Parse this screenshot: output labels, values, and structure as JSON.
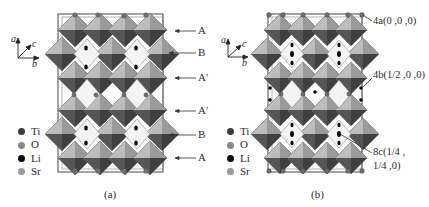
{
  "figure": {
    "panels": [
      {
        "id": "a",
        "caption": "(a)",
        "axes": {
          "a": "a",
          "b": "b",
          "c": "c"
        },
        "legend": [
          {
            "label": "Ti",
            "color": "#3a3a3a"
          },
          {
            "label": "O",
            "color": "#8a8a8a"
          },
          {
            "label": "Li",
            "color": "#0a0a0a"
          },
          {
            "label": "Sr",
            "color": "#9a9a9a"
          }
        ],
        "layer_labels": [
          "A",
          "B",
          "A′",
          "A′",
          "B",
          "A"
        ]
      },
      {
        "id": "b",
        "caption": "(b)",
        "axes": {
          "a": "a",
          "b": "b",
          "c": "c"
        },
        "legend": [
          {
            "label": "Ti",
            "color": "#3a3a3a"
          },
          {
            "label": "O",
            "color": "#8a8a8a"
          },
          {
            "label": "Li",
            "color": "#0a0a0a"
          },
          {
            "label": "Sr",
            "color": "#9a9a9a"
          }
        ],
        "site_labels": [
          {
            "label": "4a(0 ,0 ,0)"
          },
          {
            "label": "4b(1/2 ,0 ,0)"
          },
          {
            "label_line1": "8c(1/4 ,",
            "label_line2": "1/4 ,0)"
          }
        ]
      }
    ],
    "colors": {
      "polyhedron_light": "#b9b9b9",
      "polyhedron_mid": "#8c8c8c",
      "polyhedron_dark": "#4a4a4a",
      "cell_edge": "#333333",
      "text": "#2a2a2a"
    }
  }
}
